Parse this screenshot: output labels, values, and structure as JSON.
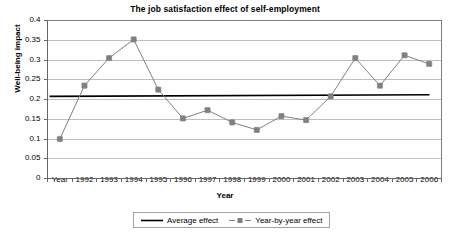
{
  "chart_data": {
    "type": "line",
    "title": "The job satisfaction effect of self-employment",
    "xlabel": "Year",
    "ylabel": "Well-being impact",
    "categories": [
      "Year",
      "1992",
      "1993",
      "1994",
      "1995",
      "1996",
      "1997",
      "1998",
      "1999",
      "2000",
      "2001",
      "2002",
      "2003",
      "2004",
      "2005",
      "2006"
    ],
    "ylim": [
      0,
      0.4
    ],
    "yticks": [
      "0",
      "0.05",
      "0.1",
      "0.15",
      "0.2",
      "0.25",
      "0.3",
      "0.35",
      "0.4"
    ],
    "ytick_values": [
      0,
      0.05,
      0.1,
      0.15,
      0.2,
      0.25,
      0.3,
      0.35,
      0.4
    ],
    "grid": true,
    "legend_position": "bottom",
    "series": [
      {
        "name": "Year-by-year effect",
        "style": "line-with-markers",
        "color": "#808080",
        "values": [
          0.1,
          0.235,
          0.305,
          0.352,
          0.225,
          0.152,
          0.173,
          0.142,
          0.123,
          0.158,
          0.148,
          0.208,
          0.305,
          0.235,
          0.312,
          0.29
        ]
      },
      {
        "name": "Average effect",
        "style": "solid-line",
        "color": "#000000",
        "value": 0.21,
        "value_start": 0.208,
        "value_end": 0.212
      }
    ],
    "legend": [
      {
        "label": "Average effect",
        "marker": "solid-line",
        "color": "#000000"
      },
      {
        "label": "Year-by-year effect",
        "marker": "line-with-square-marker",
        "color": "#808080"
      }
    ]
  },
  "colors": {
    "series_line": "#808080",
    "average_line": "#000000",
    "grid": "#bfbfbf",
    "axis": "#808080",
    "plot_border": "#808080",
    "background": "#ffffff"
  }
}
